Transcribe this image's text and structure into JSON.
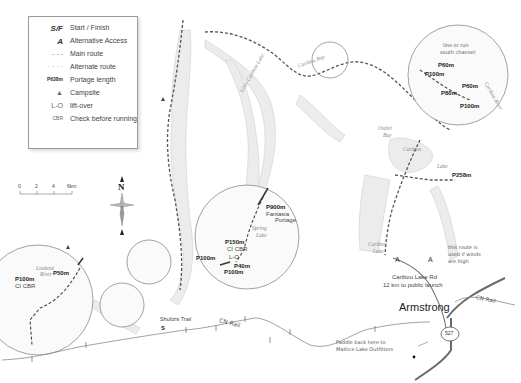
{
  "legend": {
    "items": [
      {
        "symbol": "S/F",
        "label": "Start / Finish"
      },
      {
        "symbol": "A",
        "label": "Alternative Access"
      },
      {
        "symbol": "- - -",
        "label": "Main route"
      },
      {
        "symbol": "· · · ·",
        "label": "Alternate route"
      },
      {
        "symbol": "P638m",
        "label": "Portage length"
      },
      {
        "symbol": "▲",
        "label": "Campsite"
      },
      {
        "symbol": "L-O",
        "label": "lift-over"
      },
      {
        "symbol": "CBR",
        "label": "Check before running"
      }
    ]
  },
  "scale": {
    "ticks": [
      "0",
      "2",
      "4",
      "6km"
    ]
  },
  "compass": {
    "north_label": "N"
  },
  "places": {
    "town": "Armstrong",
    "road_label_line1": "Caribou Lake Rd",
    "road_label_line2": "12 km to public launch",
    "highway": "527",
    "rail_label_1": "CN Rail",
    "rail_label_2": "CN Rail",
    "trail": "Shultzis Trail",
    "start": "S",
    "alt_access_1": "A",
    "alt_access_2": "A",
    "caribou_lake_upper": "Caribou",
    "caribou_lake_upper_2": "Lake",
    "caribou_lake_lower": "Caribou",
    "caribou_lake_lower_2": "Lake",
    "outlet_bay_1": "Outlet",
    "outlet_bay_2": "Bay",
    "caribou_bay": "Caribou Bay",
    "little_caribou": "Little Caribou Lake",
    "spring_lake_1": "Spring",
    "spring_lake_2": "Lake",
    "lookout_river_1": "Lookout",
    "lookout_river_2": "River",
    "caribou_river": "Caribou River",
    "outfitters_line1": "Paddle back here to",
    "outfitters_line2": "Mattice Lake Outfitters",
    "alt_note_line1": "this route is",
    "alt_note_line2": "used if winds",
    "alt_note_line3": "are high",
    "p258": "P258m"
  },
  "insets": {
    "northeast": {
      "note_line1": "line or run",
      "note_line2": "south channel",
      "portages": [
        "P60m",
        "P100m",
        "P60m",
        "P80m",
        "P100m"
      ]
    },
    "central": {
      "portages": [
        "P900m",
        "P150m",
        "P100m",
        "P40m",
        "P100m"
      ],
      "fantasia_1": "Fantasia",
      "fantasia_2": "Portage",
      "cbr": "CI CBR",
      "liftover": "L-O"
    },
    "west": {
      "portages": [
        "P50m",
        "P100m"
      ],
      "cbr": "CI CBR"
    }
  }
}
